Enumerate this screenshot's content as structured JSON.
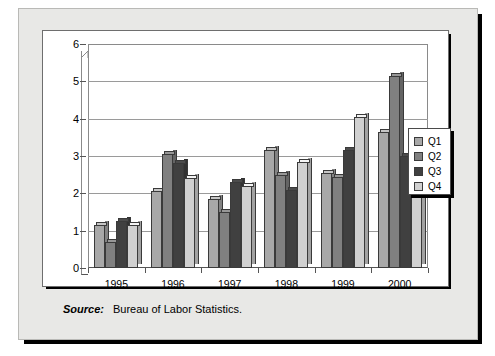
{
  "figure": {
    "source_label": "Source:",
    "source_text": "Bureau of Labor Statistics."
  },
  "legend": {
    "position": "right",
    "items": [
      {
        "label": "Q1",
        "color": "#a8a8a8"
      },
      {
        "label": "Q2",
        "color": "#808080"
      },
      {
        "label": "Q3",
        "color": "#404040"
      },
      {
        "label": "Q4",
        "color": "#d0d0d0"
      }
    ]
  },
  "chart_data": {
    "type": "bar",
    "title": "",
    "xlabel": "",
    "ylabel": "",
    "categories": [
      "1995",
      "1996",
      "1997",
      "1998",
      "1999",
      "2000"
    ],
    "series": [
      {
        "name": "Q1",
        "color": "#a8a8a8",
        "values": [
          1.15,
          2.05,
          1.85,
          3.15,
          2.55,
          3.65
        ]
      },
      {
        "name": "Q2",
        "color": "#808080",
        "values": [
          0.7,
          3.05,
          1.5,
          2.5,
          2.45,
          5.15
        ]
      },
      {
        "name": "Q3",
        "color": "#404040",
        "values": [
          1.25,
          2.8,
          2.3,
          2.1,
          3.15,
          3.0
        ]
      },
      {
        "name": "Q4",
        "color": "#d0d0d0",
        "values": [
          1.15,
          2.4,
          2.2,
          2.85,
          4.05,
          2.4
        ]
      }
    ],
    "ylim": [
      0,
      6
    ],
    "yticks": [
      0,
      1,
      2,
      3,
      4,
      5,
      6
    ],
    "ytick_labels": [
      "0",
      "1",
      "2",
      "3",
      "4",
      "5",
      "6"
    ],
    "grid": true,
    "grid_axis": "y",
    "three_d": true
  }
}
